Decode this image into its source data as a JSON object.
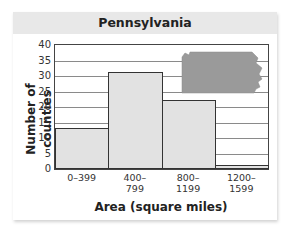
{
  "chart_data": {
    "type": "bar",
    "title": "Pennsylvania",
    "xlabel": "Area (square miles)",
    "ylabel": "Number of counties",
    "categories": [
      "0–399",
      "400–799",
      "800–1199",
      "1200–1599"
    ],
    "category_lines": [
      [
        "0–399"
      ],
      [
        "400–",
        "799"
      ],
      [
        "800–",
        "1199"
      ],
      [
        "1200–",
        "1599"
      ]
    ],
    "values": [
      13,
      31,
      22,
      1
    ],
    "ylim": [
      0,
      40
    ],
    "yticks": [
      0,
      5,
      10,
      15,
      20,
      25,
      30,
      35,
      40
    ],
    "grid": true,
    "histogram": true,
    "annotation": "Pennsylvania state silhouette (upper right)",
    "bar_color": "#e2e2e2",
    "silhouette_color": "#9a9a9a"
  },
  "labels": {
    "title": "Pennsylvania",
    "xlabel": "Area (square miles)",
    "ylabel": "Number of counties"
  }
}
